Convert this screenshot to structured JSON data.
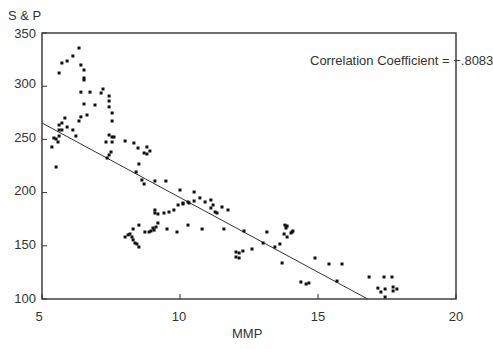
{
  "chart_data": {
    "type": "scatter",
    "title": "",
    "xlabel": "MMP",
    "ylabel": "S & P",
    "xlim": [
      5,
      20
    ],
    "ylim": [
      100,
      350
    ],
    "xticks": [
      5,
      10,
      15,
      20
    ],
    "yticks": [
      100,
      150,
      200,
      250,
      300,
      350
    ],
    "grid": false,
    "legend": null,
    "annotations": [
      {
        "text": "Correlation Coefficient  =  −.8083",
        "x": 14.2,
        "y": 323
      }
    ],
    "regression_line": {
      "x": [
        5,
        16.8
      ],
      "y": [
        265.4,
        100
      ]
    },
    "correlation_coefficient": -0.8083,
    "series": [
      {
        "name": "S & P vs MMP",
        "points": [
          [
            6.34,
            335.9
          ],
          [
            6.12,
            328.4
          ],
          [
            5.91,
            323.7
          ],
          [
            5.72,
            321.8
          ],
          [
            5.62,
            312.4
          ],
          [
            6.41,
            319.9
          ],
          [
            6.52,
            315.2
          ],
          [
            6.52,
            307.7
          ],
          [
            6.52,
            305.8
          ],
          [
            6.41,
            294.5
          ],
          [
            6.74,
            294.5
          ],
          [
            7.14,
            293.6
          ],
          [
            7.21,
            297.4
          ],
          [
            7.43,
            290.8
          ],
          [
            7.43,
            286.1
          ],
          [
            7.43,
            280.5
          ],
          [
            7.54,
            274.8
          ],
          [
            7.54,
            267.3
          ],
          [
            6.92,
            282.3
          ],
          [
            6.52,
            283.3
          ],
          [
            6.63,
            272.9
          ],
          [
            6.41,
            271.1
          ],
          [
            6.34,
            267.3
          ],
          [
            5.83,
            270.1
          ],
          [
            5.72,
            265.4
          ],
          [
            5.62,
            263.5
          ],
          [
            5.62,
            258.8
          ],
          [
            5.72,
            258.8
          ],
          [
            5.91,
            261.7
          ],
          [
            6.12,
            258.8
          ],
          [
            6.23,
            253.2
          ],
          [
            5.62,
            253.2
          ],
          [
            5.43,
            251.3
          ],
          [
            5.51,
            250.4
          ],
          [
            5.58,
            247.6
          ],
          [
            5.36,
            242.9
          ],
          [
            5.51,
            224.1
          ],
          [
            7.43,
            254.1
          ],
          [
            7.54,
            252.3
          ],
          [
            7.61,
            252.3
          ],
          [
            7.32,
            247.6
          ],
          [
            7.54,
            247.6
          ],
          [
            7.5,
            238.2
          ],
          [
            7.43,
            235.3
          ],
          [
            7.36,
            232.5
          ],
          [
            8.01,
            248.5
          ],
          [
            8.33,
            246.6
          ],
          [
            8.48,
            241.9
          ],
          [
            8.8,
            242.9
          ],
          [
            8.7,
            237.2
          ],
          [
            8.8,
            236.3
          ],
          [
            8.91,
            239.1
          ],
          [
            8.51,
            226.9
          ],
          [
            8.41,
            219.4
          ],
          [
            8.62,
            211.8
          ],
          [
            8.7,
            208.1
          ],
          [
            9.09,
            210.9
          ],
          [
            9.49,
            210.9
          ],
          [
            10.0,
            202.4
          ],
          [
            10.51,
            200.6
          ],
          [
            10.51,
            192.1
          ],
          [
            10.72,
            195.0
          ],
          [
            10.91,
            191.2
          ],
          [
            11.12,
            193.0
          ],
          [
            11.2,
            188.3
          ],
          [
            11.12,
            185.5
          ],
          [
            11.27,
            181.8
          ],
          [
            11.34,
            180.8
          ],
          [
            11.52,
            186.5
          ],
          [
            11.74,
            183.6
          ],
          [
            9.09,
            183.6
          ],
          [
            9.09,
            180.8
          ],
          [
            9.2,
            179.9
          ],
          [
            9.42,
            180.8
          ],
          [
            9.6,
            181.8
          ],
          [
            9.78,
            183.6
          ],
          [
            9.93,
            188.3
          ],
          [
            10.11,
            189.3
          ],
          [
            10.29,
            191.2
          ],
          [
            10.11,
            190.2
          ],
          [
            10.33,
            190.2
          ],
          [
            8.3,
            165.8
          ],
          [
            8.51,
            169.5
          ],
          [
            8.73,
            163.0
          ],
          [
            8.88,
            163.0
          ],
          [
            8.95,
            163.9
          ],
          [
            9.02,
            166.7
          ],
          [
            9.06,
            164.8
          ],
          [
            9.13,
            167.7
          ],
          [
            9.2,
            171.4
          ],
          [
            9.53,
            165.8
          ],
          [
            9.89,
            163.0
          ],
          [
            10.29,
            169.5
          ],
          [
            8.01,
            158.3
          ],
          [
            8.12,
            160.2
          ],
          [
            8.19,
            161.1
          ],
          [
            8.26,
            158.3
          ],
          [
            8.3,
            155.5
          ],
          [
            8.37,
            152.6
          ],
          [
            8.44,
            151.7
          ],
          [
            8.51,
            148.9
          ],
          [
            10.8,
            165.8
          ],
          [
            11.59,
            165.8
          ],
          [
            12.32,
            163.9
          ],
          [
            13.15,
            163.0
          ],
          [
            13.01,
            152.6
          ],
          [
            13.44,
            148.9
          ],
          [
            13.62,
            151.7
          ],
          [
            12.03,
            144.2
          ],
          [
            12.14,
            143.2
          ],
          [
            12.28,
            145.1
          ],
          [
            12.61,
            147.0
          ],
          [
            12.03,
            139.5
          ],
          [
            12.14,
            138.5
          ],
          [
            13.8,
            169.5
          ],
          [
            13.88,
            168.6
          ],
          [
            13.84,
            166.7
          ],
          [
            13.77,
            161.1
          ],
          [
            13.88,
            158.3
          ],
          [
            14.02,
            162.0
          ],
          [
            14.06,
            163.0
          ],
          [
            14.09,
            163.9
          ],
          [
            13.7,
            133.8
          ],
          [
            14.89,
            138.5
          ],
          [
            15.4,
            132.9
          ],
          [
            15.87,
            132.9
          ],
          [
            14.38,
            116.0
          ],
          [
            14.57,
            114.1
          ],
          [
            14.67,
            115.0
          ],
          [
            15.69,
            116.9
          ],
          [
            16.85,
            120.7
          ],
          [
            17.39,
            120.7
          ],
          [
            17.68,
            120.7
          ],
          [
            17.17,
            110.2
          ],
          [
            17.28,
            106.6
          ],
          [
            17.43,
            109.4
          ],
          [
            17.72,
            111.3
          ],
          [
            17.72,
            107.5
          ],
          [
            17.86,
            109.4
          ],
          [
            17.43,
            101.9
          ]
        ]
      }
    ]
  },
  "labels": {
    "ylabel": "S & P",
    "xlabel": "MMP",
    "annotation": "Correlation Coefficient  =  −.8083",
    "yticks": [
      "350",
      "300",
      "250",
      "200",
      "150",
      "100"
    ],
    "xticks": [
      "5",
      "10",
      "15",
      "20"
    ]
  },
  "style": {
    "axis_color": "#333333",
    "point_color": "#111111",
    "line_color": "#333333"
  }
}
